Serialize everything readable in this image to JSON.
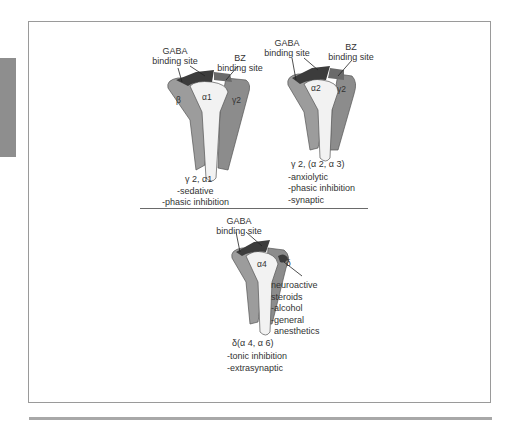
{
  "figure": {
    "receptors": [
      {
        "id": "receptor-1",
        "gaba_label_line1": "GABA",
        "gaba_label_line2": "binding site",
        "bz_label_line1": "BZ",
        "bz_label_line2": "binding site",
        "subunit_alpha": "α1",
        "subunit_beta": "β",
        "subunit_gamma": "γ2",
        "subtype": "γ 2, α1",
        "properties": [
          "-sedative",
          "-phasic inhibition"
        ]
      },
      {
        "id": "receptor-2",
        "gaba_label_line1": "GABA",
        "gaba_label_line2": "binding site",
        "bz_label_line1": "BZ",
        "bz_label_line2": "binding site",
        "subunit_alpha": "α2",
        "subunit_gamma": "γ2",
        "subtype": "γ 2, (α 2, α 3)",
        "properties": [
          "-anxiolytic",
          "-phasic inhibition",
          "-synaptic"
        ]
      },
      {
        "id": "receptor-3",
        "gaba_label_line1": "GABA",
        "gaba_label_line2": "binding site",
        "subunit_alpha": "α4",
        "subunit_delta": "δ",
        "modulators": [
          "neuroactive",
          "steroids",
          "-alcohol",
          "-general",
          "anesthetics"
        ],
        "subtype": "δ(α 4, α 6)",
        "properties": [
          "-tonic inhibition",
          "-extrasynaptic"
        ]
      }
    ],
    "colors": {
      "subunit_dark": "#7d7d7d",
      "subunit_mid": "#a3a3a3",
      "pore": "#f2f2f2",
      "binding_site": "#3c3c3c",
      "frame": "#9a9a9a",
      "sidebar_tab": "#8e8e8e"
    }
  }
}
